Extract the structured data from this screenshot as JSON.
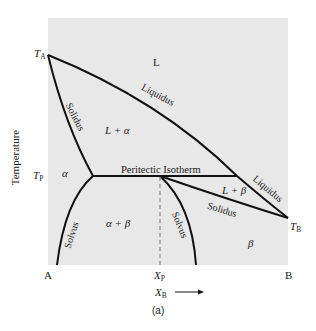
{
  "diagram": {
    "type": "peritectic phase diagram",
    "panel_label": "(a)",
    "y_axis_label": "Temperature",
    "x_axis": {
      "variable": "X",
      "variable_sub": "B",
      "arrow": "⟶",
      "left_end": "A",
      "right_end": "B",
      "xp_label": "X",
      "xp_sub": "P"
    },
    "temperatures": {
      "ta": "T",
      "ta_sub": "A",
      "tp": "T",
      "tp_sub": "P",
      "tb": "T",
      "tb_sub": "B"
    },
    "regions": {
      "liquid": "L",
      "l_alpha": "L + α",
      "alpha": "α",
      "alpha_beta": "α + β",
      "l_beta": "L + β",
      "beta": "β"
    },
    "curves": {
      "liquidus_upper": "Liquidus",
      "liquidus_lower": "Liquidus",
      "solidus_left": "Solidus",
      "solidus_right": "Solidus",
      "solvus_left": "Solvus",
      "solvus_right": "Solvus",
      "isotherm": "Peritectic Isotherm"
    },
    "colors": {
      "background": "#e8e8e8",
      "line": "#111111",
      "dashed": "#888888"
    }
  }
}
